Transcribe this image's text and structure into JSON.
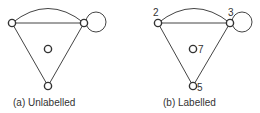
{
  "figures": [
    {
      "id": "a",
      "caption": "(a) Unlabelled",
      "node_labels": [
        "",
        "",
        "",
        ""
      ]
    },
    {
      "id": "b",
      "caption": "(b) Labelled",
      "node_labels": [
        "2",
        "3",
        "7",
        "5"
      ]
    }
  ],
  "colors": {
    "stroke": "#333333",
    "background": "#ffffff"
  }
}
